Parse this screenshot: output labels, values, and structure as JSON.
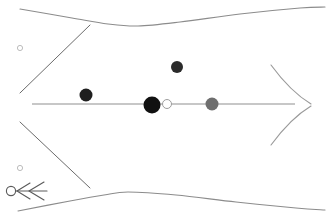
{
  "figure": {
    "title": "Axisymmetric flow field schematic",
    "width": 333,
    "height": 219,
    "background_color": "#ffffff"
  },
  "chart_data": {
    "type": "scatter",
    "title": "Axisymmetric flow field schematic",
    "subtitle": "",
    "xlabel": "",
    "ylabel": "",
    "xlim": [
      0,
      333
    ],
    "ylim": [
      219,
      0
    ],
    "grid": false,
    "legend": "none",
    "axis_units": "pixels",
    "series": [
      {
        "name": "particles",
        "type": "scatter",
        "points": [
          {
            "label": "particle-1",
            "x": 86,
            "y": 95,
            "r": 6.5,
            "color": "#1f1f1f",
            "fill": "solid"
          },
          {
            "label": "particle-2",
            "x": 177,
            "y": 67,
            "r": 6.0,
            "color": "#2b2b2b",
            "fill": "solid"
          },
          {
            "label": "particle-3",
            "x": 152,
            "y": 105,
            "r": 8.5,
            "color": "#111111",
            "fill": "solid"
          },
          {
            "label": "particle-4",
            "x": 167,
            "y": 104,
            "r": 4.5,
            "color": "#ffffff",
            "fill": "open"
          },
          {
            "label": "particle-5",
            "x": 212,
            "y": 104,
            "r": 6.5,
            "color": "#6e6e6e",
            "fill": "solid"
          }
        ]
      },
      {
        "name": "reference-markers",
        "type": "scatter",
        "points": [
          {
            "label": "reference-marker-upper",
            "x": 20,
            "y": 48,
            "r": 2.6,
            "color": "#b4b4b4",
            "fill": "open"
          },
          {
            "label": "reference-marker-lower",
            "x": 20,
            "y": 168,
            "r": 2.6,
            "color": "#b4b4b4",
            "fill": "open"
          }
        ]
      }
    ],
    "annotations": [
      {
        "label": "upper-wall",
        "type": "polyline",
        "stroke": "#8c8c8c",
        "points": [
          [
            20,
            9
          ],
          [
            72,
            18
          ],
          [
            108,
            24
          ],
          [
            138,
            26
          ],
          [
            180,
            22
          ],
          [
            240,
            14
          ],
          [
            300,
            8
          ],
          [
            325,
            7
          ]
        ]
      },
      {
        "label": "lower-wall",
        "type": "polyline",
        "stroke": "#8c8c8c",
        "points": [
          [
            18,
            211
          ],
          [
            70,
            201
          ],
          [
            104,
            195
          ],
          [
            128,
            192
          ],
          [
            176,
            195
          ],
          [
            236,
            202
          ],
          [
            296,
            208
          ],
          [
            325,
            210
          ]
        ]
      },
      {
        "label": "upper-oblique-shock",
        "type": "line",
        "stroke": "#6b6b6b",
        "points": [
          [
            20,
            93
          ],
          [
            90,
            25
          ]
        ]
      },
      {
        "label": "lower-oblique-shock",
        "type": "line",
        "stroke": "#6b6b6b",
        "points": [
          [
            20,
            122
          ],
          [
            90,
            188
          ]
        ]
      },
      {
        "label": "upper-tail-curve",
        "type": "polyline",
        "stroke": "#9a9a9a",
        "points": [
          [
            271,
            65
          ],
          [
            286,
            78
          ],
          [
            300,
            92
          ],
          [
            311,
            103
          ]
        ]
      },
      {
        "label": "lower-tail-curve",
        "type": "polyline",
        "stroke": "#9a9a9a",
        "points": [
          [
            271,
            145
          ],
          [
            286,
            132
          ],
          [
            300,
            118
          ],
          [
            311,
            107
          ]
        ]
      },
      {
        "label": "centerline-axis",
        "type": "line",
        "stroke": "#8f8f8f",
        "points": [
          [
            32,
            104
          ],
          [
            295,
            104
          ]
        ]
      },
      {
        "label": "flow-direction-arrow",
        "type": "arrow",
        "direction": "left",
        "stroke": "#5a5a5a",
        "tail": [
          47,
          191
        ],
        "head": [
          18,
          191
        ],
        "barbs": 2
      }
    ]
  },
  "elements": {
    "upper_wall_name": "upper-wall",
    "lower_wall_name": "lower-wall",
    "centerline_name": "centerline-axis",
    "arrow_name": "flow-direction-arrow"
  }
}
